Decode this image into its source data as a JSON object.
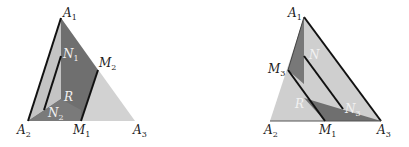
{
  "figure_left": {
    "name": "left-triangle",
    "vertices": {
      "A1": [
        61,
        18
      ],
      "A2": [
        28,
        121
      ],
      "A3": [
        135,
        121
      ],
      "M1": [
        81,
        121
      ],
      "M2": [
        98,
        70
      ],
      "N1": [
        61,
        56
      ],
      "N2": [
        44,
        110
      ]
    },
    "labels": [
      {
        "id": "A1",
        "base": "A",
        "sub": "1",
        "x": 62,
        "y": 17,
        "white": false
      },
      {
        "id": "N1",
        "base": "N",
        "sub": "1",
        "x": 63,
        "y": 57,
        "white": true
      },
      {
        "id": "M2",
        "base": "M",
        "sub": "2",
        "x": 99,
        "y": 66,
        "white": false
      },
      {
        "id": "R",
        "base": "R",
        "sub": "",
        "x": 63,
        "y": 101,
        "white": true
      },
      {
        "id": "N2",
        "base": "N",
        "sub": "2",
        "x": 47,
        "y": 117,
        "white": true
      },
      {
        "id": "A2",
        "base": "A",
        "sub": "2",
        "x": 17,
        "y": 133,
        "white": false
      },
      {
        "id": "M1",
        "base": "M",
        "sub": "1",
        "x": 73,
        "y": 133,
        "white": false
      },
      {
        "id": "A3",
        "base": "A",
        "sub": "3",
        "x": 133,
        "y": 133,
        "white": false
      }
    ]
  },
  "figure_right": {
    "name": "right-triangle",
    "vertices": {
      "A1": [
        304,
        17
      ],
      "A2": [
        270,
        121
      ],
      "A3": [
        381,
        121
      ],
      "M1": [
        325,
        121
      ],
      "M3": [
        288,
        70
      ],
      "N": [
        304,
        56
      ],
      "N3": [
        343,
        109
      ]
    },
    "labels": [
      {
        "id": "A1",
        "base": "A",
        "sub": "1",
        "x": 288,
        "y": 17,
        "white": false
      },
      {
        "id": "N",
        "base": "N",
        "sub": "",
        "x": 310,
        "y": 58,
        "white": true
      },
      {
        "id": "M3",
        "base": "M",
        "sub": "3",
        "x": 268,
        "y": 72,
        "white": false
      },
      {
        "id": "R",
        "base": "R",
        "sub": "",
        "x": 295,
        "y": 107,
        "white": true
      },
      {
        "id": "N3",
        "base": "N",
        "sub": "3",
        "x": 346,
        "y": 113,
        "white": true
      },
      {
        "id": "A2",
        "base": "A",
        "sub": "2",
        "x": 264,
        "y": 133,
        "white": false
      },
      {
        "id": "M1",
        "base": "M",
        "sub": "1",
        "x": 320,
        "y": 133,
        "white": false
      },
      {
        "id": "A3",
        "base": "A",
        "sub": "3",
        "x": 378,
        "y": 133,
        "white": false
      }
    ]
  },
  "colors": {
    "dark": "#6e6e6e",
    "mid": "#9a9a9a",
    "light": "#cfcfcf",
    "line": "#111111"
  }
}
